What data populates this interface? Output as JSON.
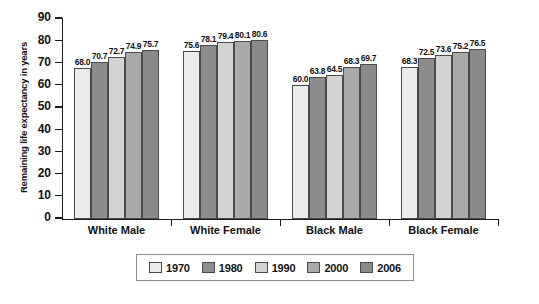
{
  "chart_data": {
    "type": "bar",
    "title": "",
    "subtitle": "",
    "xlabel": "",
    "ylabel": "Remaining life expectancy in years",
    "ylim": [
      0,
      90
    ],
    "ytick_step": 10,
    "yticks": [
      "90",
      "80",
      "70",
      "60",
      "50",
      "40",
      "30",
      "20",
      "10",
      "0"
    ],
    "grid": false,
    "legend_position": "bottom",
    "categories": [
      "White Male",
      "White Female",
      "Black Male",
      "Black Female"
    ],
    "series": [
      {
        "name": "1970",
        "color": "#ebebe9",
        "values": [
          68.0,
          75.6,
          60.0,
          68.3
        ]
      },
      {
        "name": "1980",
        "color": "#8d8d8d",
        "values": [
          70.7,
          78.1,
          63.8,
          72.5
        ]
      },
      {
        "name": "1990",
        "color": "#d3d3d1",
        "values": [
          72.7,
          79.4,
          64.5,
          73.6
        ]
      },
      {
        "name": "2000",
        "color": "#a9a9a7",
        "values": [
          74.9,
          80.1,
          68.3,
          75.2
        ]
      },
      {
        "name": "2006",
        "color": "#8a8a8a",
        "values": [
          75.7,
          80.6,
          69.7,
          76.5
        ]
      }
    ],
    "data_labels": [
      [
        "68.0",
        "70.7",
        "72.7",
        "74.9",
        "75.7"
      ],
      [
        "75.6",
        "78.1",
        "79.4",
        "80.1",
        "80.6"
      ],
      [
        "60.0",
        "63.8",
        "64.5",
        "68.3",
        "69.7"
      ],
      [
        "68.3",
        "72.5",
        "73.6",
        "75.2",
        "76.5"
      ]
    ]
  },
  "legend": {
    "items": [
      {
        "label": "1970",
        "color": "#ebebe9"
      },
      {
        "label": "1980",
        "color": "#8d8d8d"
      },
      {
        "label": "1990",
        "color": "#d3d3d1"
      },
      {
        "label": "2000",
        "color": "#a9a9a7"
      },
      {
        "label": "2006",
        "color": "#8a8a8a"
      }
    ]
  }
}
